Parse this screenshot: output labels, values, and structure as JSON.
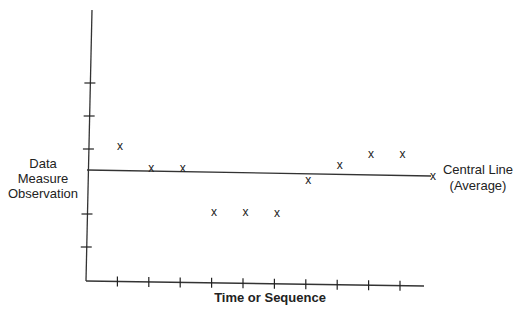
{
  "chart_data": {
    "type": "scatter",
    "title": "",
    "xlabel": "Time or Sequence",
    "ylabel": "Data Measure Observation",
    "ylabel_lines": [
      "Data",
      "Measure",
      "Observation"
    ],
    "marker": "x",
    "x": [
      1,
      2,
      3,
      4,
      5,
      6,
      7,
      8,
      9,
      10
    ],
    "values": [
      0.75,
      0.1,
      0.1,
      -1.2,
      -1.2,
      -1.2,
      -0.2,
      0.3,
      0.65,
      0.65
    ],
    "reference_lines": [
      {
        "name": "Central Line (Average)",
        "label_lines": [
          "Central Line",
          "(Average)"
        ],
        "value": 0
      }
    ],
    "x_ticks": 10,
    "y_ticks": 5,
    "tick_labels_shown": false,
    "grid": false,
    "legend": "none",
    "colors": {
      "ink": "#222222",
      "background": "#ffffff"
    }
  },
  "labels": {
    "y_axis": [
      "Data",
      "Measure",
      "Observation"
    ],
    "x_axis": "Time or Sequence",
    "central_line": [
      "Central Line",
      "(Average)"
    ],
    "marker_glyph": "x"
  }
}
